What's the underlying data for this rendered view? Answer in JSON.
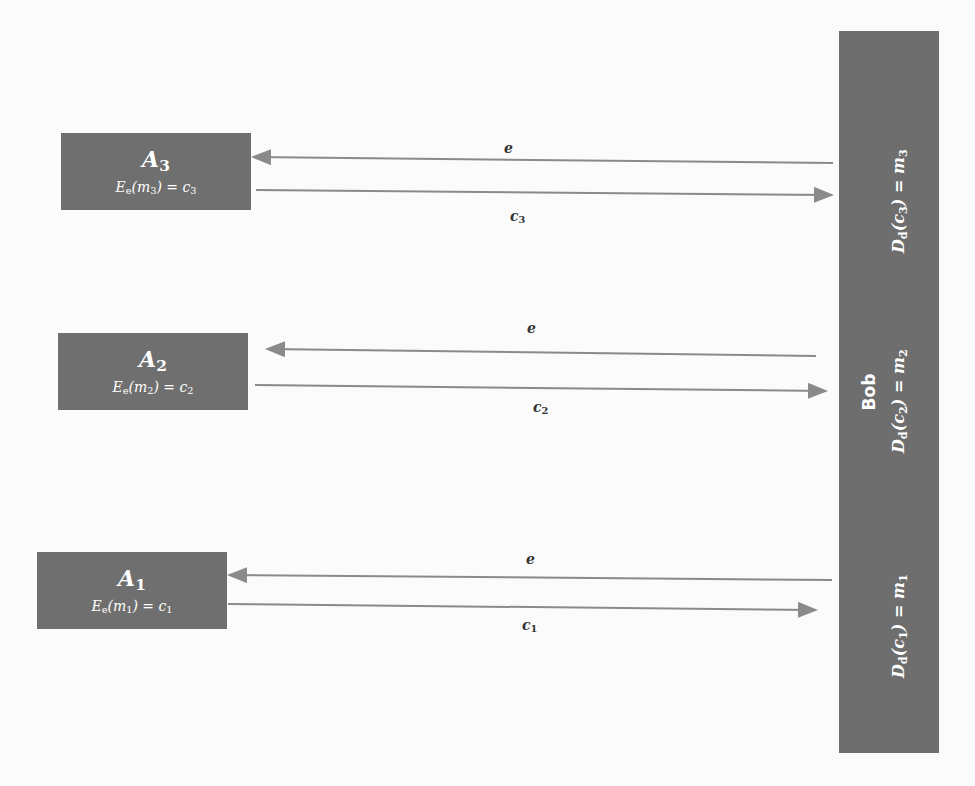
{
  "senders": [
    {
      "id": "A3",
      "name": "A",
      "index": "3",
      "enc": {
        "E": "E",
        "key": "e",
        "m": "m",
        "mi": "3",
        "c": "c",
        "ci": "3"
      }
    },
    {
      "id": "A2",
      "name": "A",
      "index": "2",
      "enc": {
        "E": "E",
        "key": "e",
        "m": "m",
        "mi": "2",
        "c": "c",
        "ci": "2"
      }
    },
    {
      "id": "A1",
      "name": "A",
      "index": "1",
      "enc": {
        "E": "E",
        "key": "e",
        "m": "m",
        "mi": "1",
        "c": "c",
        "ci": "1"
      }
    }
  ],
  "receiver": {
    "name": "Bob",
    "decryptions": [
      {
        "text": "D",
        "key": "d",
        "c": "c",
        "ci": "1",
        "m": "m",
        "mi": "1"
      },
      {
        "text": "D",
        "key": "d",
        "c": "c",
        "ci": "2",
        "m": "m",
        "mi": "2"
      },
      {
        "text": "D",
        "key": "d",
        "c": "c",
        "ci": "3",
        "m": "m",
        "mi": "3"
      }
    ]
  },
  "arrows": [
    {
      "from": "Bob",
      "to": "A3",
      "label": "e"
    },
    {
      "from": "A3",
      "to": "Bob",
      "label": "c",
      "label_sub": "3"
    },
    {
      "from": "Bob",
      "to": "A2",
      "label": "e"
    },
    {
      "from": "A2",
      "to": "Bob",
      "label": "c",
      "label_sub": "2"
    },
    {
      "from": "Bob",
      "to": "A1",
      "label": "e"
    },
    {
      "from": "A1",
      "to": "Bob",
      "label": "c",
      "label_sub": "1"
    }
  ],
  "colors": {
    "box": "#6f6f6f",
    "arrow": "#8a8a8a",
    "text_on_box": "#ffffff"
  }
}
